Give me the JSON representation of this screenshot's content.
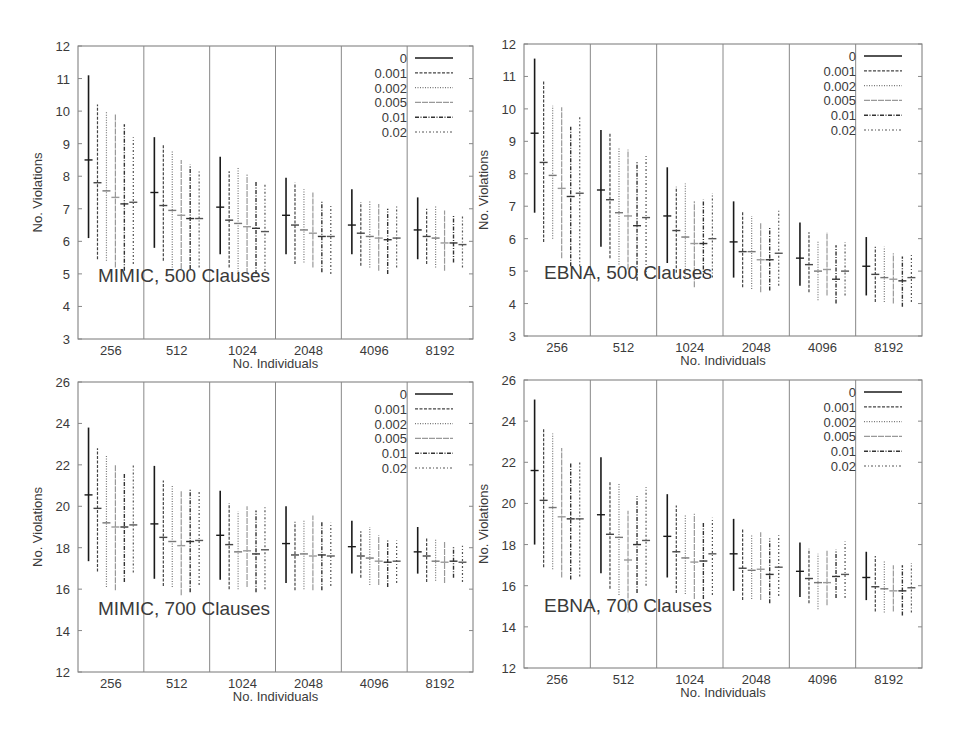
{
  "figure": {
    "legend_title": "",
    "legend": [
      {
        "label": "0",
        "dash": ""
      },
      {
        "label": "0.001",
        "dash": "3,1.5"
      },
      {
        "label": "0.002",
        "dash": "1,1.5"
      },
      {
        "label": "0.005",
        "dash": "6,1"
      },
      {
        "label": "0.01",
        "dash": "4,1.5,1,1.5"
      },
      {
        "label": "0.02",
        "dash": "2,2,1,2"
      }
    ]
  },
  "chart_data": [
    {
      "type": "errorbar",
      "title": "MIMIC, 500 Clauses",
      "xlabel": "No. Individuals",
      "ylabel": "No. Violations",
      "categories": [
        "256",
        "512",
        "1024",
        "2048",
        "4096",
        "8192"
      ],
      "ylim": [
        3,
        12
      ],
      "yticks": [
        3,
        4,
        5,
        6,
        7,
        8,
        9,
        10,
        11,
        12
      ],
      "legend_position": "upper right",
      "series": [
        {
          "name": "0",
          "mean": [
            8.5,
            7.5,
            7.05,
            6.8,
            6.5,
            6.35
          ],
          "low": [
            6.1,
            5.8,
            5.6,
            5.6,
            5.6,
            5.45
          ],
          "high": [
            11.1,
            9.2,
            8.6,
            7.95,
            7.6,
            7.35
          ]
        },
        {
          "name": "0.001",
          "mean": [
            7.8,
            7.1,
            6.65,
            6.5,
            6.25,
            6.15
          ],
          "low": [
            5.45,
            5.4,
            5.2,
            5.3,
            5.25,
            5.3
          ],
          "high": [
            10.2,
            9.0,
            8.15,
            7.8,
            7.2,
            7.0
          ]
        },
        {
          "name": "0.002",
          "mean": [
            7.55,
            6.95,
            6.55,
            6.35,
            6.15,
            6.1
          ],
          "low": [
            5.4,
            5.2,
            5.0,
            5.35,
            5.2,
            5.2
          ],
          "high": [
            10.0,
            8.8,
            8.3,
            7.6,
            7.25,
            7.1
          ]
        },
        {
          "name": "0.005",
          "mean": [
            7.35,
            6.8,
            6.45,
            6.25,
            6.1,
            5.95
          ],
          "low": [
            5.2,
            5.15,
            5.0,
            5.2,
            5.1,
            5.1
          ],
          "high": [
            9.9,
            8.5,
            8.05,
            7.5,
            7.15,
            6.95
          ]
        },
        {
          "name": "0.01",
          "mean": [
            7.15,
            6.7,
            6.4,
            6.15,
            6.05,
            5.95
          ],
          "low": [
            5.1,
            5.15,
            5.0,
            5.05,
            5.0,
            5.35
          ],
          "high": [
            9.6,
            8.35,
            7.85,
            7.25,
            7.0,
            6.8
          ]
        },
        {
          "name": "0.02",
          "mean": [
            7.2,
            6.7,
            6.3,
            6.15,
            6.1,
            5.9
          ],
          "low": [
            5.3,
            5.2,
            5.1,
            5.0,
            5.2,
            5.2
          ],
          "high": [
            9.2,
            8.2,
            7.75,
            7.15,
            7.1,
            6.8
          ]
        }
      ]
    },
    {
      "type": "errorbar",
      "title": "EBNA, 500 Clauses",
      "xlabel": "No. Individuals",
      "ylabel": "No. Violations",
      "categories": [
        "256",
        "512",
        "1024",
        "2048",
        "4096",
        "8192"
      ],
      "ylim": [
        3,
        12
      ],
      "yticks": [
        3,
        4,
        5,
        6,
        7,
        8,
        9,
        10,
        11,
        12
      ],
      "legend_position": "upper right",
      "series": [
        {
          "name": "0",
          "mean": [
            9.25,
            7.5,
            6.7,
            5.9,
            5.4,
            5.15
          ],
          "low": [
            6.8,
            5.75,
            5.25,
            4.8,
            4.55,
            4.25
          ],
          "high": [
            11.55,
            9.35,
            8.2,
            7.15,
            6.5,
            6.05
          ]
        },
        {
          "name": "0.001",
          "mean": [
            8.35,
            7.2,
            6.25,
            5.6,
            5.2,
            4.9
          ],
          "low": [
            5.9,
            5.4,
            4.95,
            4.5,
            4.35,
            4.05
          ],
          "high": [
            10.85,
            9.25,
            7.6,
            6.85,
            6.2,
            5.75
          ]
        },
        {
          "name": "0.002",
          "mean": [
            7.95,
            6.8,
            6.05,
            5.6,
            5.0,
            4.8
          ],
          "low": [
            6.0,
            5.2,
            4.75,
            4.45,
            4.1,
            4.05
          ],
          "high": [
            10.1,
            8.8,
            7.7,
            6.7,
            5.95,
            5.75
          ]
        },
        {
          "name": "0.005",
          "mean": [
            7.55,
            6.7,
            5.85,
            5.35,
            5.05,
            4.75
          ],
          "low": [
            5.4,
            5.05,
            4.5,
            4.35,
            4.25,
            4.0
          ],
          "high": [
            10.05,
            8.75,
            7.15,
            6.5,
            6.2,
            5.55
          ]
        },
        {
          "name": "0.01",
          "mean": [
            7.3,
            6.4,
            5.85,
            5.35,
            4.75,
            4.7
          ],
          "low": [
            5.15,
            4.7,
            4.8,
            4.4,
            4.0,
            3.9
          ],
          "high": [
            9.45,
            8.4,
            7.2,
            6.35,
            5.8,
            5.45
          ]
        },
        {
          "name": "0.02",
          "mean": [
            7.4,
            6.65,
            6.0,
            5.55,
            5.0,
            4.8
          ],
          "low": [
            5.15,
            4.85,
            4.8,
            4.55,
            4.25,
            4.05
          ],
          "high": [
            9.8,
            8.55,
            7.4,
            6.9,
            5.9,
            5.55
          ]
        }
      ]
    },
    {
      "type": "errorbar",
      "title": "MIMIC, 700 Clauses",
      "xlabel": "No. Individuals",
      "ylabel": "No. Violations",
      "categories": [
        "256",
        "512",
        "1024",
        "2048",
        "4096",
        "8192"
      ],
      "ylim": [
        12,
        26
      ],
      "yticks": [
        12,
        14,
        16,
        18,
        20,
        22,
        24,
        26
      ],
      "legend_position": "upper right",
      "series": [
        {
          "name": "0",
          "mean": [
            20.55,
            19.15,
            18.6,
            18.2,
            18.05,
            17.8
          ],
          "low": [
            17.35,
            16.5,
            16.45,
            16.3,
            16.75,
            16.75
          ],
          "high": [
            23.8,
            21.95,
            20.75,
            20.0,
            19.3,
            19.0
          ]
        },
        {
          "name": "0.001",
          "mean": [
            19.9,
            18.5,
            18.15,
            17.65,
            17.6,
            17.6
          ],
          "low": [
            16.85,
            16.15,
            16.0,
            15.95,
            16.55,
            16.35
          ],
          "high": [
            22.8,
            21.25,
            20.15,
            19.25,
            18.8,
            18.45
          ]
        },
        {
          "name": "0.002",
          "mean": [
            19.2,
            18.3,
            17.8,
            17.7,
            17.5,
            17.35
          ],
          "low": [
            16.1,
            16.1,
            16.0,
            16.0,
            16.2,
            16.4
          ],
          "high": [
            22.5,
            21.05,
            19.75,
            19.35,
            19.0,
            18.4
          ]
        },
        {
          "name": "0.005",
          "mean": [
            19.0,
            18.1,
            17.85,
            17.6,
            17.35,
            17.3
          ],
          "low": [
            15.95,
            15.7,
            16.1,
            15.95,
            16.2,
            16.3
          ],
          "high": [
            22.0,
            20.75,
            20.0,
            19.55,
            18.6,
            18.3
          ]
        },
        {
          "name": "0.01",
          "mean": [
            19.0,
            18.3,
            17.7,
            17.65,
            17.3,
            17.35
          ],
          "low": [
            16.35,
            15.85,
            15.85,
            15.95,
            16.1,
            16.55
          ],
          "high": [
            21.6,
            20.85,
            19.8,
            19.3,
            18.4,
            18.05
          ]
        },
        {
          "name": "0.02",
          "mean": [
            19.1,
            18.35,
            17.9,
            17.6,
            17.35,
            17.3
          ],
          "low": [
            16.8,
            16.2,
            16.0,
            16.15,
            16.3,
            16.35
          ],
          "high": [
            22.05,
            20.75,
            20.05,
            19.2,
            18.35,
            18.1
          ]
        }
      ]
    },
    {
      "type": "errorbar",
      "title": "EBNA, 700 Clauses",
      "xlabel": "No. Individuals",
      "ylabel": "No. Violations",
      "categories": [
        "256",
        "512",
        "1024",
        "2048",
        "4096",
        "8192"
      ],
      "ylim": [
        12,
        26
      ],
      "yticks": [
        12,
        14,
        16,
        18,
        20,
        22,
        24,
        26
      ],
      "legend_position": "upper right",
      "series": [
        {
          "name": "0",
          "mean": [
            21.6,
            19.45,
            18.4,
            17.55,
            16.7,
            16.4
          ],
          "low": [
            18.0,
            16.6,
            16.4,
            15.75,
            15.45,
            15.3
          ],
          "high": [
            25.05,
            22.25,
            20.45,
            19.25,
            18.1,
            17.65
          ]
        },
        {
          "name": "0.001",
          "mean": [
            20.15,
            18.5,
            17.65,
            16.85,
            16.35,
            15.95
          ],
          "low": [
            16.9,
            15.85,
            15.65,
            15.3,
            15.15,
            14.75
          ],
          "high": [
            23.6,
            21.1,
            19.9,
            18.75,
            17.8,
            17.45
          ]
        },
        {
          "name": "0.002",
          "mean": [
            19.8,
            18.35,
            17.35,
            16.75,
            16.15,
            15.85
          ],
          "low": [
            16.8,
            15.55,
            15.6,
            15.35,
            14.85,
            14.7
          ],
          "high": [
            23.4,
            20.95,
            19.45,
            18.5,
            17.55,
            17.2
          ]
        },
        {
          "name": "0.005",
          "mean": [
            19.35,
            17.25,
            17.15,
            16.8,
            16.15,
            15.75
          ],
          "low": [
            16.4,
            14.7,
            15.35,
            15.3,
            15.05,
            14.75
          ],
          "high": [
            22.7,
            19.65,
            19.5,
            18.6,
            17.7,
            17.0
          ]
        },
        {
          "name": "0.01",
          "mean": [
            19.25,
            18.0,
            17.2,
            16.55,
            16.45,
            15.75
          ],
          "low": [
            16.3,
            15.65,
            15.35,
            15.15,
            15.4,
            14.55
          ],
          "high": [
            21.95,
            20.35,
            19.05,
            18.3,
            17.75,
            17.0
          ]
        },
        {
          "name": "0.02",
          "mean": [
            19.25,
            18.2,
            17.55,
            16.9,
            16.55,
            15.9
          ],
          "low": [
            16.45,
            16.0,
            15.55,
            15.5,
            15.4,
            14.7
          ],
          "high": [
            22.05,
            20.8,
            19.3,
            18.45,
            18.15,
            17.1
          ]
        }
      ]
    }
  ],
  "layout": {
    "panels": [
      {
        "left": 78,
        "top": 46,
        "right": 473,
        "bottom": 339
      },
      {
        "left": 524,
        "top": 44,
        "right": 922,
        "bottom": 336
      },
      {
        "left": 78,
        "top": 382,
        "right": 473,
        "bottom": 672
      },
      {
        "left": 524,
        "top": 380,
        "right": 922,
        "bottom": 668
      }
    ]
  }
}
